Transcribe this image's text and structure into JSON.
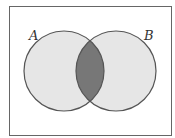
{
  "diagram": {
    "type": "venn",
    "sets": [
      {
        "label": "A",
        "cx": 64,
        "cy": 71,
        "r": 40
      },
      {
        "label": "B",
        "cx": 116,
        "cy": 71,
        "r": 40
      }
    ],
    "highlighted_region": "A ∩ B",
    "colors": {
      "border": "#555555",
      "circle_fill": "#e6e6e6",
      "intersection_fill": "#777777",
      "background": "#ffffff"
    }
  }
}
